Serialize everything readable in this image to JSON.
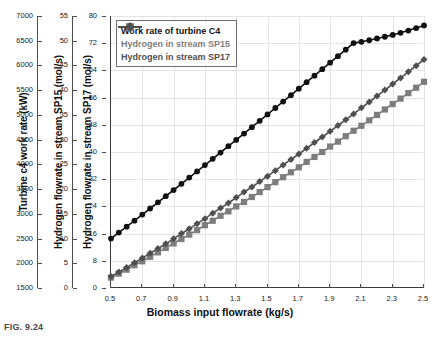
{
  "figure": {
    "caption": "FIG. 9.24"
  },
  "chart_data": {
    "type": "line",
    "title": "",
    "xlabel": "Biomass input flowrate (kg/s)",
    "x": [
      0.5,
      0.55,
      0.6,
      0.65,
      0.7,
      0.75,
      0.8,
      0.85,
      0.9,
      0.95,
      1.0,
      1.05,
      1.1,
      1.15,
      1.2,
      1.25,
      1.3,
      1.35,
      1.4,
      1.45,
      1.5,
      1.55,
      1.6,
      1.65,
      1.7,
      1.75,
      1.8,
      1.85,
      1.9,
      1.95,
      2.0,
      2.05,
      2.1,
      2.15,
      2.2,
      2.25,
      2.3,
      2.35,
      2.4,
      2.45,
      2.5
    ],
    "xlim": [
      0.5,
      2.5
    ],
    "xticks": [
      "0.5",
      "0.7",
      "0.9",
      "1.1",
      "1.3",
      "1.5",
      "1.7",
      "1.9",
      "2.1",
      "2.3",
      "2.5"
    ],
    "grid": true,
    "legend_position": "top-left",
    "axes": [
      {
        "id": "axis-work-rate",
        "label": "Turbine c4 work rate (kW)",
        "unit": "kW",
        "lim": [
          1500,
          7000
        ],
        "ticks": [
          "1500",
          "2000",
          "2500",
          "3000",
          "3500",
          "4000",
          "4500",
          "5000",
          "5500",
          "6000",
          "6500",
          "7000"
        ]
      },
      {
        "id": "axis-sp15",
        "label": "Hydrogen flowrate in stream SP15 (mol/s)",
        "unit": "mol/s",
        "lim": [
          0,
          55
        ],
        "ticks": [
          "0",
          "5",
          "10",
          "15",
          "20",
          "25",
          "30",
          "35",
          "40",
          "45",
          "50",
          "55"
        ]
      },
      {
        "id": "axis-sp17",
        "label": "Hydrogen flowrate in stream SP17 (mol/s)",
        "unit": "mol/s",
        "lim": [
          0,
          80
        ],
        "ticks": [
          "0",
          "8",
          "16",
          "24",
          "32",
          "40",
          "48",
          "56",
          "64",
          "72",
          "80"
        ]
      }
    ],
    "series": [
      {
        "name": "Work rate of turbine C4",
        "axis": "axis-work-rate",
        "color": "#111111",
        "marker": "circle",
        "values": [
          2500,
          2620,
          2740,
          2862,
          2985,
          3108,
          3232,
          3356,
          3481,
          3606,
          3732,
          3858,
          3985,
          4112,
          4239,
          4367,
          4495,
          4623,
          4752,
          4881,
          5010,
          5140,
          5270,
          5400,
          5531,
          5662,
          5793,
          5924,
          6056,
          6188,
          6320,
          6452,
          6478,
          6510,
          6545,
          6580,
          6618,
          6660,
          6705,
          6755,
          6810
        ]
      },
      {
        "name": "Hydrogen in stream SP15",
        "axis": "axis-sp15",
        "color": "#7d7d7d",
        "marker": "square",
        "values": [
          2.1,
          2.9,
          3.7,
          4.6,
          5.4,
          6.3,
          7.2,
          8.1,
          9.0,
          9.9,
          10.8,
          11.7,
          12.7,
          13.6,
          14.6,
          15.5,
          16.5,
          17.4,
          18.4,
          19.4,
          20.4,
          21.4,
          22.4,
          23.4,
          24.4,
          25.5,
          26.5,
          27.5,
          28.6,
          29.6,
          30.7,
          31.8,
          32.8,
          33.9,
          35.0,
          36.1,
          37.2,
          38.3,
          39.4,
          40.5,
          41.7
        ]
      },
      {
        "name": "Hydrogen in stream SP17",
        "axis": "axis-sp17",
        "color": "#4f4f4f",
        "marker": "diamond",
        "values": [
          3.4,
          4.7,
          6.0,
          7.4,
          8.8,
          10.2,
          11.6,
          13.0,
          14.5,
          16.0,
          17.4,
          18.9,
          20.4,
          22.0,
          23.5,
          25.0,
          26.6,
          28.2,
          29.7,
          31.3,
          32.9,
          34.5,
          36.2,
          37.8,
          39.4,
          41.1,
          42.8,
          44.4,
          46.1,
          47.8,
          49.5,
          51.2,
          53.0,
          54.7,
          56.5,
          58.2,
          60.0,
          61.8,
          63.6,
          65.4,
          67.2
        ]
      }
    ]
  }
}
